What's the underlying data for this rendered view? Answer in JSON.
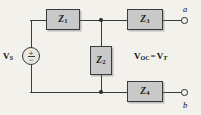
{
  "figure": {
    "type": "circuit-diagram",
    "background_color": "#f3f1ec",
    "wire_color": "#3b3b3b",
    "box_fill_color": "#c9c9c9",
    "box_border_color": "#3a3a3a"
  },
  "source": {
    "label_v": "V",
    "label_sub": "S",
    "polarity_plus": "+",
    "polarity_minus": "−",
    "symbol_name": "ac-voltage-source"
  },
  "impedances": [
    {
      "label_z": "Z",
      "label_sub": "1",
      "name": "impedance-z1"
    },
    {
      "label_z": "Z",
      "label_sub": "2",
      "name": "impedance-z2"
    },
    {
      "label_z": "Z",
      "label_sub": "3",
      "name": "impedance-z3"
    },
    {
      "label_z": "Z",
      "label_sub": "4",
      "name": "impedance-z4"
    }
  ],
  "terminals": [
    {
      "label": "a",
      "name": "terminal-a"
    },
    {
      "label": "b",
      "name": "terminal-b"
    }
  ],
  "equation": {
    "left_v": "V",
    "left_sub": "OC",
    "operator": "=",
    "right_v": "V",
    "right_sub": "T",
    "full_text": "V_OC = V_T"
  },
  "junctions": [
    {
      "name": "junction-top-node"
    },
    {
      "name": "junction-bottom-node"
    }
  ]
}
